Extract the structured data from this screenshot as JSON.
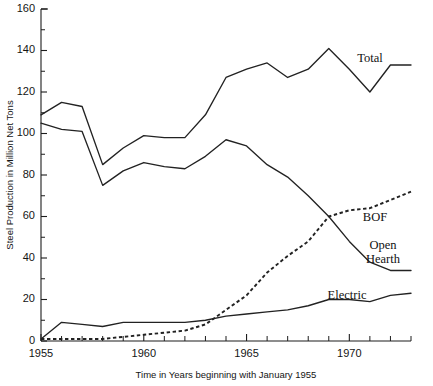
{
  "chart_data": {
    "type": "line",
    "title": "",
    "xlabel": "Time in Years beginning with January 1955",
    "ylabel": "Steel Production in Million Net Tons",
    "xlim": [
      1955,
      1973
    ],
    "ylim": [
      0,
      160
    ],
    "grid": false,
    "legend_position": "inline-right-labels",
    "x": [
      1955,
      1956,
      1957,
      1958,
      1959,
      1960,
      1961,
      1962,
      1963,
      1964,
      1965,
      1966,
      1967,
      1968,
      1969,
      1970,
      1971,
      1972,
      1973
    ],
    "y_ticks": [
      0,
      20,
      40,
      60,
      80,
      100,
      120,
      140,
      160
    ],
    "y_minor_ticks": [
      10,
      30,
      50,
      70,
      90,
      110,
      130,
      150
    ],
    "x_ticks_labeled": [
      1955,
      1960,
      1965,
      1970
    ],
    "x_tick_labels": [
      "1955",
      "1960",
      "1965",
      "1970"
    ],
    "series": [
      {
        "name": "Total",
        "label": "Total",
        "style": "solid",
        "values": [
          109,
          115,
          113,
          85,
          93,
          99,
          98,
          98,
          109,
          127,
          131,
          134,
          127,
          131,
          141,
          131,
          120,
          133,
          133
        ]
      },
      {
        "name": "Open Hearth",
        "label": "Open Hearth",
        "style": "solid",
        "values": [
          105,
          102,
          101,
          75,
          82,
          86,
          84,
          83,
          89,
          97,
          94,
          85,
          79,
          70,
          60,
          48,
          38,
          34,
          34
        ]
      },
      {
        "name": "BOF",
        "label": "BOF",
        "style": "dashed",
        "values": [
          1,
          1,
          1,
          1,
          2,
          3,
          4,
          5,
          8,
          15,
          22,
          33,
          41,
          48,
          60,
          63,
          64,
          68,
          72
        ]
      },
      {
        "name": "Electric",
        "label": "Electric",
        "style": "solid",
        "values": [
          1,
          9,
          8,
          7,
          9,
          9,
          9,
          9,
          10,
          12,
          13,
          14,
          15,
          17,
          20,
          20,
          19,
          22,
          23
        ]
      }
    ],
    "series_label_positions": [
      {
        "name": "Total",
        "x_px": 370,
        "y_px": 62
      },
      {
        "name": "BOF",
        "x_px": 375,
        "y_px": 221
      },
      {
        "name": "Open Hearth",
        "x_px": 383,
        "y_px": 249
      },
      {
        "name": "Electric",
        "x_px": 347,
        "y_px": 299
      }
    ]
  },
  "plot_geometry": {
    "left_px": 41,
    "right_px": 411,
    "top_px": 9,
    "bottom_px": 341
  }
}
